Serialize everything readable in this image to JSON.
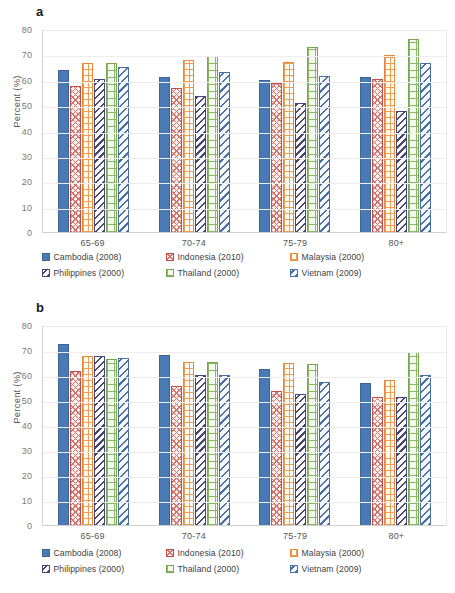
{
  "figure": {
    "panels": [
      {
        "letter": "a"
      },
      {
        "letter": "b"
      }
    ]
  },
  "axis": {
    "ylabel": "Percent (%)",
    "yticks": [
      "80",
      "70",
      "60",
      "50",
      "40",
      "30",
      "20",
      "10",
      "0"
    ],
    "ymin": 0,
    "ymax": 80,
    "xticks": [
      "65-69",
      "70-74",
      "75-79",
      "80+"
    ]
  },
  "legend": {
    "rows": [
      [
        {
          "label": "Cambodia (2008)",
          "series": "cambodia"
        },
        {
          "label": "Indonesia (2010)",
          "series": "indonesia"
        },
        {
          "label": "Malaysia (2000)",
          "series": "malaysia"
        }
      ],
      [
        {
          "label": "Philippines (2000)",
          "series": "philippines"
        },
        {
          "label": "Thailand (2000)",
          "series": "thailand"
        },
        {
          "label": "Vietnam (2009)",
          "series": "vietnam"
        }
      ]
    ]
  },
  "colors": {
    "cambodia": "#4a7ab5",
    "indonesia": "#c0504d",
    "malaysia": "#e8883c",
    "philippines": "#46467a",
    "thailand": "#77a653",
    "vietnam": "#4a6fa5",
    "grid": "#eeeeee",
    "axis": "#cfcfcf",
    "text": "#404040"
  },
  "chart_data": [
    {
      "type": "bar",
      "panel": "a",
      "title": "a",
      "xlabel": "",
      "ylabel": "Percent (%)",
      "ylim": [
        0,
        80
      ],
      "ytick_step": 10,
      "grid": true,
      "legend_position": "bottom",
      "categories": [
        "65-69",
        "70-74",
        "75-79",
        "80+"
      ],
      "series": [
        {
          "name": "Cambodia (2008)",
          "values": [
            64.1,
            61.3,
            60.2,
            61.4
          ]
        },
        {
          "name": "Indonesia (2010)",
          "values": [
            58.0,
            57.3,
            59.3,
            60.8
          ]
        },
        {
          "name": "Malaysia (2000)",
          "values": [
            67.0,
            68.3,
            67.2,
            70.1
          ]
        },
        {
          "name": "Philippines (2000)",
          "values": [
            60.7,
            54.0,
            51.4,
            47.9
          ]
        },
        {
          "name": "Thailand (2000)",
          "values": [
            67.1,
            69.6,
            73.3,
            76.6
          ]
        },
        {
          "name": "Vietnam (2009)",
          "values": [
            65.4,
            63.3,
            61.9,
            67.0
          ]
        }
      ]
    },
    {
      "type": "bar",
      "panel": "b",
      "title": "b",
      "xlabel": "",
      "ylabel": "Percent (%)",
      "ylim": [
        0,
        80
      ],
      "ytick_step": 10,
      "grid": true,
      "legend_position": "bottom",
      "categories": [
        "65-69",
        "70-74",
        "75-79",
        "80+"
      ],
      "series": [
        {
          "name": "Cambodia (2008)",
          "values": [
            72.8,
            68.6,
            62.9,
            57.2
          ]
        },
        {
          "name": "Indonesia (2010)",
          "values": [
            61.9,
            56.2,
            54.0,
            51.8
          ]
        },
        {
          "name": "Malaysia (2000)",
          "values": [
            68.1,
            65.5,
            65.3,
            58.3
          ]
        },
        {
          "name": "Philippines (2000)",
          "values": [
            68.2,
            60.3,
            53.0,
            51.5
          ]
        },
        {
          "name": "Thailand (2000)",
          "values": [
            66.9,
            65.6,
            65.0,
            69.8
          ]
        },
        {
          "name": "Vietnam (2009)",
          "values": [
            67.2,
            60.5,
            57.8,
            60.3
          ]
        }
      ]
    }
  ]
}
